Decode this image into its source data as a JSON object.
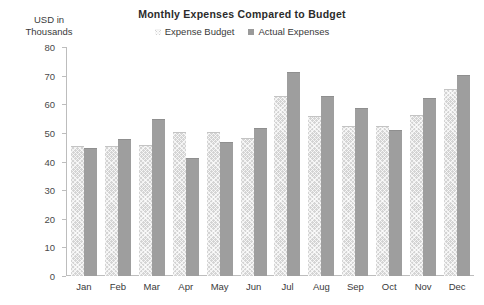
{
  "chart_data": {
    "type": "bar",
    "title": "Monthly Expenses Compared to Budget",
    "xlabel": "",
    "ylabel": "USD in Thousands",
    "ylim": [
      0,
      80
    ],
    "yticks": [
      0,
      10,
      20,
      30,
      40,
      50,
      60,
      70,
      80
    ],
    "grid": false,
    "legend_position": "top-center",
    "categories": [
      "Jan",
      "Feb",
      "Mar",
      "Apr",
      "May",
      "Jun",
      "Jul",
      "Aug",
      "Sep",
      "Oct",
      "Nov",
      "Dec"
    ],
    "series": [
      {
        "name": "Expense Budget",
        "color": "#d4d4d4",
        "values": [
          45,
          45,
          45.5,
          50,
          50,
          48,
          62.5,
          55.5,
          52,
          52,
          56,
          65
        ]
      },
      {
        "name": "Actual Expenses",
        "color": "#9e9e9e",
        "values": [
          44.5,
          47.5,
          54.5,
          41,
          46.5,
          51.5,
          71,
          62.5,
          58.5,
          50.5,
          62,
          70
        ]
      }
    ]
  },
  "axis_title_lines": [
    "USD in",
    "Thousands"
  ]
}
